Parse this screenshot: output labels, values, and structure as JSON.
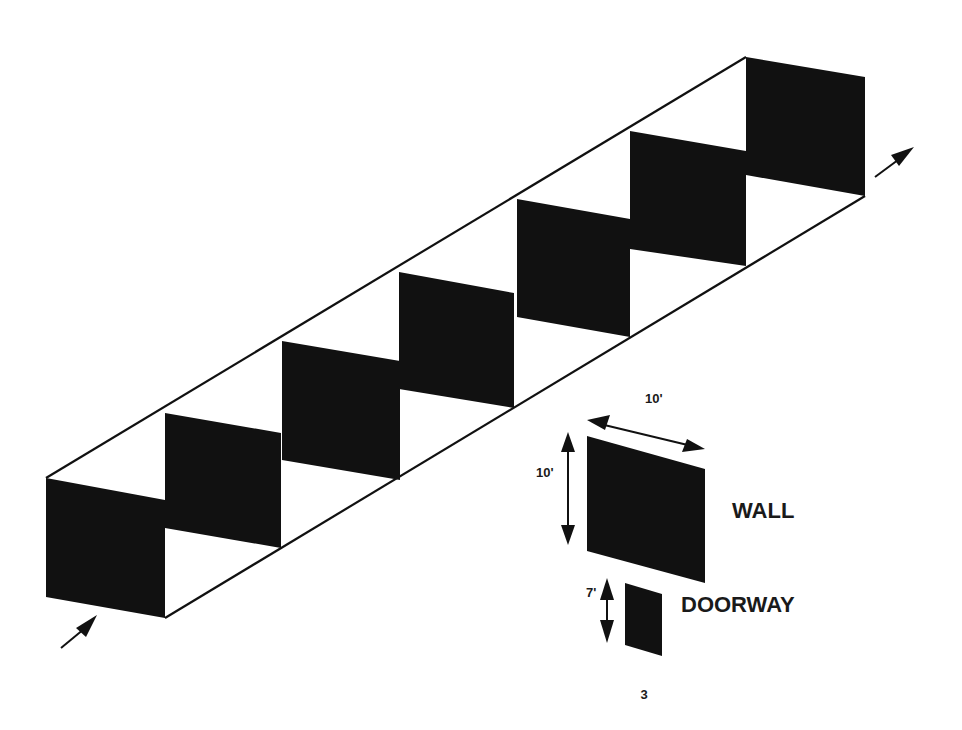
{
  "diagram": {
    "type": "isometric-corridor",
    "entry_arrow": "arrow-in",
    "exit_arrow": "arrow-out",
    "panel_count": 7,
    "colors": {
      "panel": "#111111",
      "line": "#111111",
      "background": "#ffffff"
    }
  },
  "legend": {
    "wall": {
      "label": "WALL",
      "width_label": "10'",
      "height_label": "10'"
    },
    "doorway": {
      "label": "DOORWAY",
      "height_label": "7'"
    }
  },
  "page_number": "3"
}
